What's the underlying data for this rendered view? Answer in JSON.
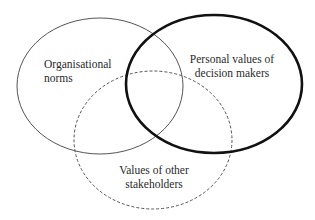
{
  "diagram": {
    "type": "venn",
    "sets": [
      {
        "id": "organisational-norms",
        "label_lines": [
          "Organisational",
          "norms"
        ],
        "stroke": "#555555",
        "stroke_style": "solid-thin",
        "ellipse": {
          "cx": 100,
          "cy": 86,
          "rx": 83,
          "ry": 68
        }
      },
      {
        "id": "personal-values",
        "label_lines": [
          "Personal values of",
          "decision makers"
        ],
        "stroke": "#111111",
        "stroke_style": "solid-bold",
        "ellipse": {
          "cx": 214,
          "cy": 84,
          "rx": 88,
          "ry": 69
        }
      },
      {
        "id": "stakeholder-values",
        "label_lines": [
          "Values of other",
          "stakeholders"
        ],
        "stroke": "#555555",
        "stroke_style": "dashed",
        "ellipse": {
          "cx": 153,
          "cy": 140,
          "rx": 79,
          "ry": 69
        }
      }
    ]
  }
}
